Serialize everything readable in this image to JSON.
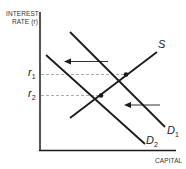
{
  "diagram": {
    "type": "supply-demand",
    "y_axis": {
      "label_line1": "INTEREST",
      "label_line2": "RATE (r)"
    },
    "x_axis": {
      "label": "CAPITAL"
    },
    "curves": [
      {
        "id": "S",
        "label": "S",
        "slope": "upward"
      },
      {
        "id": "D1",
        "label": "D",
        "subscript": "1",
        "slope": "downward"
      },
      {
        "id": "D2",
        "label": "D",
        "subscript": "2",
        "slope": "downward"
      }
    ],
    "levels": [
      {
        "id": "r1",
        "label": "r",
        "subscript": "1"
      },
      {
        "id": "r2",
        "label": "r",
        "subscript": "2"
      }
    ],
    "shift": {
      "from": "D1",
      "to": "D2",
      "direction": "left"
    },
    "colors": {
      "line": "#1a1a1a",
      "dashed": "#999999",
      "text": "#333333"
    }
  }
}
